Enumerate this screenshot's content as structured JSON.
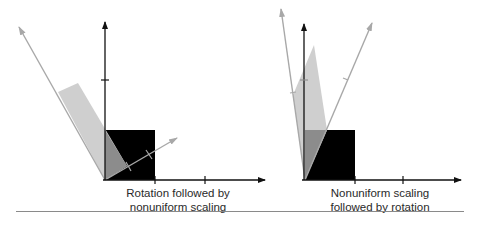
{
  "figure": {
    "panels": [
      {
        "id": "left",
        "caption_line1": "Rotation followed by",
        "caption_line2": "nonuniform scaling",
        "origin": [
          105,
          180
        ],
        "unit_square_corner": [
          155,
          130
        ],
        "x_axis_end": [
          265,
          180
        ],
        "y_axis_end": [
          105,
          20
        ],
        "x_ticks": [
          155,
          205
        ],
        "y_ticks": [
          80
        ],
        "transformed_shape": "parallelogram"
      },
      {
        "id": "right",
        "caption_line1": "Nonuniform scaling",
        "caption_line2": "followed by rotation",
        "origin": [
          305,
          180
        ],
        "unit_square_corner": [
          355,
          130
        ],
        "x_axis_end": [
          462,
          180
        ],
        "y_axis_end": [
          304,
          22
        ],
        "x_ticks": [
          355,
          403
        ],
        "y_ticks": [
          80
        ],
        "transformed_shape": "parallelogram"
      }
    ],
    "colors": {
      "axis": "#111111",
      "square": "#000000",
      "transformed_axis": "#a8a8a8",
      "transformed_shape": "#cfcfcf",
      "overlap": "#8c8c8c",
      "caption": "#2a2a2a",
      "divider": "#8a8a8a"
    }
  }
}
